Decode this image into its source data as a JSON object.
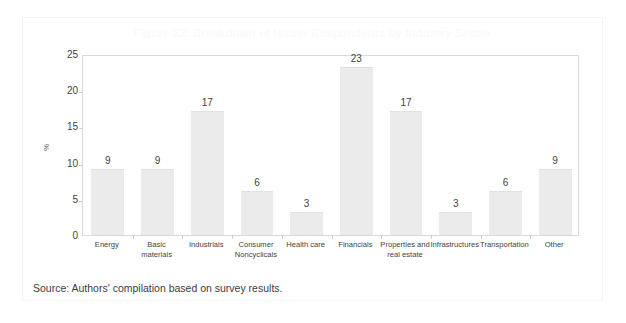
{
  "figure": {
    "title": "Figure 22: Breakdown of Issuer Respondents by Industry Sector",
    "source_note": "Source: Authors' compilation based on survey results."
  },
  "colors": {
    "bar_fill": "#ebebeb",
    "bar_border": "#e2e2e2",
    "plot_border": "#d9d9d9",
    "value_label": "#434343",
    "tick_label": "#3f3f3f",
    "title": "#fafafa"
  },
  "chart_data": {
    "type": "bar",
    "title": "Figure 22: Breakdown of Issuer Respondents by Industry Sector",
    "xlabel": "",
    "ylabel": "%",
    "ylim": [
      0,
      25
    ],
    "yticks": [
      0,
      5,
      10,
      15,
      20,
      25
    ],
    "grid": false,
    "legend": "none",
    "categories": [
      "Energy",
      "Basic materials",
      "Industrials",
      "Consumer Noncyclicals",
      "Health care",
      "Financials",
      "Properties and real estate",
      "Infrastructures",
      "Transportation",
      "Other"
    ],
    "values": [
      9,
      9,
      17,
      6,
      3,
      23,
      17,
      3,
      6,
      9
    ],
    "data_labels": [
      "9",
      "9",
      "17",
      "6",
      "3",
      "23",
      "17",
      "3",
      "6",
      "9"
    ]
  }
}
